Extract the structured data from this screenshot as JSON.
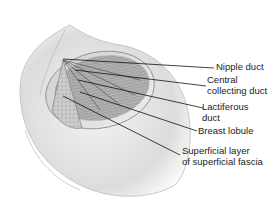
{
  "diagram": {
    "labels": [
      {
        "id": "nipple-duct",
        "lines": [
          "Nipple duct"
        ]
      },
      {
        "id": "central-collecting-duct",
        "lines": [
          "Central",
          "collecting duct"
        ]
      },
      {
        "id": "lactiferous-duct",
        "lines": [
          "Lactiferous",
          "duct"
        ]
      },
      {
        "id": "breast-lobule",
        "lines": [
          "Breast lobule"
        ]
      },
      {
        "id": "superficial-fascia",
        "lines": [
          "Superficial layer",
          "of superficial fascia"
        ]
      }
    ]
  }
}
